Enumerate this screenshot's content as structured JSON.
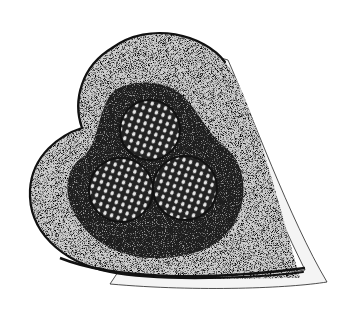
{
  "image": {
    "subject": "heart-shaped tray with three spherical clustered nodules in a dark bed",
    "style": "black and white stipple illustration",
    "colors": {
      "background": "#ffffff",
      "outline": "#111111",
      "stipple_light": "#d9d9d9",
      "stipple_dark": "#3a3a3a",
      "bed": "#1c1c1c",
      "sphere_base": "#2a2a2a",
      "sphere_highlight": "#eeeeee",
      "rim": "#f2f2f2"
    },
    "spheres": [
      {
        "cx": 150,
        "cy": 130,
        "r": 30
      },
      {
        "cx": 121,
        "cy": 190,
        "r": 32
      },
      {
        "cx": 185,
        "cy": 188,
        "r": 32
      }
    ]
  }
}
